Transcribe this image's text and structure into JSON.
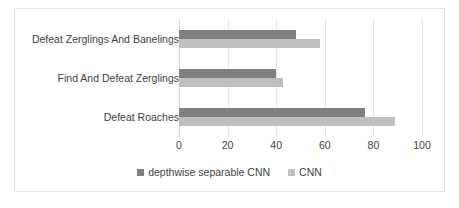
{
  "chart_data": {
    "type": "bar",
    "orientation": "horizontal",
    "title": "",
    "subtitle": "",
    "xlabel": "",
    "ylabel": "",
    "xlim": [
      0,
      100
    ],
    "xticks": [
      0,
      20,
      40,
      60,
      80,
      100
    ],
    "xtick_labels": [
      "0",
      "20",
      "40",
      "60",
      "80",
      "100"
    ],
    "grid": true,
    "grid_axis": "x",
    "legend_position": "bottom-center",
    "categories": [
      "Defeat Zerglings And Banelings",
      "Find And Defeat Zerglings",
      "Defeat Roaches"
    ],
    "series": [
      {
        "name": "depthwise separable CNN",
        "color": "#808080",
        "values": [
          48,
          40,
          76.5
        ]
      },
      {
        "name": "CNN",
        "color": "#bfbfbf",
        "values": [
          58,
          43,
          89
        ]
      }
    ]
  },
  "style": {
    "border_color": "#e3e3e3",
    "gridline_color": "#e6e6e6",
    "axis_color": "#d9d9d9",
    "text_color": "#3f3f3f",
    "background": "#ffffff"
  }
}
